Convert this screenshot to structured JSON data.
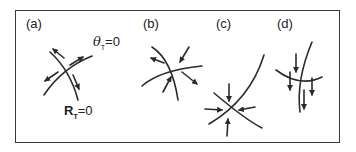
{
  "figure": {
    "panels": [
      {
        "id": "a",
        "label": "(a)"
      },
      {
        "id": "b",
        "label": "(b)"
      },
      {
        "id": "c",
        "label": "(c)"
      },
      {
        "id": "d",
        "label": "(d)"
      }
    ],
    "annotations": {
      "theta_symbol": "θ",
      "theta_sub": "T",
      "theta_eq": "=0",
      "r_symbol": "R",
      "r_sub": "T",
      "r_eq": "=0"
    },
    "colors": {
      "ink": "#2a2a2a",
      "frame": "#3a3a3a",
      "background": "#ffffff"
    }
  }
}
